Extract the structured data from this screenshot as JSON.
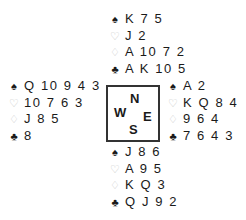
{
  "suits": {
    "spades": {
      "symbol": "♠",
      "icon": "spade-icon",
      "tone": "black"
    },
    "hearts": {
      "symbol": "♡",
      "icon": "heart-icon",
      "tone": "light"
    },
    "diamonds": {
      "symbol": "♢",
      "icon": "diamond-icon",
      "tone": "light"
    },
    "clubs": {
      "symbol": "♣",
      "icon": "club-icon",
      "tone": "black"
    }
  },
  "hands": {
    "north": {
      "spades": "K 7 5",
      "hearts": "J 2",
      "diamonds": "A 10 7 2",
      "clubs": "A K 10 5"
    },
    "west": {
      "spades": "Q 10 9 4 3",
      "hearts": "10 7 6 3",
      "diamonds": "J 8 5",
      "clubs": "8"
    },
    "east": {
      "spades": "A 2",
      "hearts": "K Q 8 4",
      "diamonds": "9 6 4",
      "clubs": "7 6 4 3"
    },
    "south": {
      "spades": "J 8 6",
      "hearts": "A 9 5",
      "diamonds": "K Q 3",
      "clubs": "Q J 9 2"
    }
  },
  "compass": {
    "north": "N",
    "west": "W",
    "east": "E",
    "south": "S"
  },
  "colors": {
    "text": "#1a1a1a",
    "red_suit_outline": "#c8c8c8",
    "box_border": "#333333"
  }
}
